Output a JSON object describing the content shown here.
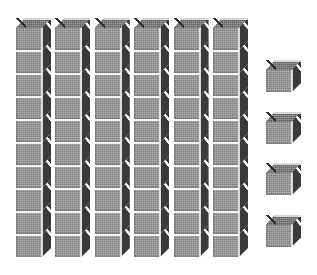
{
  "figure": {
    "background_color": "#ffffff"
  },
  "colors": {
    "front_face": "#8f8f8f",
    "top_face": "#6f6f6f",
    "side_face": "#3a3a3a",
    "top_highlight": "#d8d8d8",
    "separator": "#f4f4f4",
    "outline": "#2f2f2f"
  },
  "geometry": {
    "cube_front_width": 26,
    "cube_front_height": 23,
    "depth_x": 9,
    "depth_y": 9,
    "rod_spacing": 39.4,
    "rod_first_x": 16,
    "rod_top_y": 18,
    "single_x": 266,
    "single_first_y": 60,
    "single_spacing": 51.5
  },
  "chart_data": {
    "type": "bar",
    "subtitle": "Place value representation",
    "xlabel": "",
    "ylabel": "Unit cubes",
    "categories": [
      "Rod 1",
      "Rod 2",
      "Rod 3",
      "Rod 4",
      "Rod 5",
      "Rod 6",
      "Unit 1",
      "Unit 2",
      "Unit 3",
      "Unit 4"
    ],
    "values": [
      10,
      10,
      10,
      10,
      10,
      10,
      1,
      1,
      1,
      1
    ],
    "series": [
      {
        "name": "Rods (tens)",
        "count": 6,
        "cubes_each": 10,
        "total": 60
      },
      {
        "name": "Units (ones)",
        "count": 4,
        "cubes_each": 1,
        "total": 4
      }
    ],
    "ylim": [
      0,
      10
    ],
    "grid": false,
    "legend": "none",
    "total_value": 64,
    "tens": 6,
    "ones": 4
  },
  "blocks": {
    "rods": [
      {
        "label": "rod-1",
        "cubes": 10
      },
      {
        "label": "rod-2",
        "cubes": 10
      },
      {
        "label": "rod-3",
        "cubes": 10
      },
      {
        "label": "rod-4",
        "cubes": 10
      },
      {
        "label": "rod-5",
        "cubes": 10
      },
      {
        "label": "rod-6",
        "cubes": 10
      }
    ],
    "units": [
      {
        "label": "unit-1"
      },
      {
        "label": "unit-2"
      },
      {
        "label": "unit-3"
      },
      {
        "label": "unit-4"
      }
    ]
  }
}
